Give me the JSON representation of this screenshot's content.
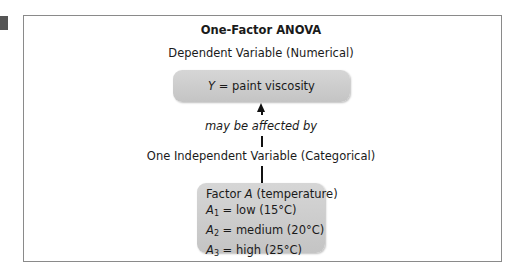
{
  "diagram": {
    "title": "One-Factor ANOVA",
    "dependent_label": "Dependent Variable (Numerical)",
    "dependent_box": {
      "symbol": "Y",
      "equals": " = paint viscosity"
    },
    "relation_label": "may be affected by",
    "independent_label": "One Independent Variable (Categorical)",
    "factor_box": {
      "factor_prefix": "Factor ",
      "factor_symbol": "A",
      "factor_suffix": " (temperature)",
      "levels": [
        {
          "symbol": "A",
          "sub": "1",
          "text": " = low (15°C)"
        },
        {
          "symbol": "A",
          "sub": "2",
          "text": " = medium (20°C)"
        },
        {
          "symbol": "A",
          "sub": "3",
          "text": " = high (25°C)"
        }
      ]
    },
    "colors": {
      "box_fill": "#cccccc",
      "frame_border": "#8a8a8a",
      "connector": "#111111"
    }
  }
}
